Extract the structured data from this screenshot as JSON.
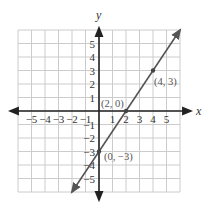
{
  "chart_data": {
    "type": "line",
    "title": "",
    "xlabel": "x",
    "ylabel": "y",
    "xlim": [
      -6,
      6
    ],
    "ylim": [
      -6,
      6
    ],
    "grid": true,
    "x_ticks": [
      -5,
      -4,
      -3,
      -2,
      -1,
      1,
      2,
      3,
      4,
      5
    ],
    "y_ticks": [
      -5,
      -4,
      -3,
      -2,
      -1,
      1,
      2,
      3,
      4,
      5
    ],
    "x_tick_labels": [
      "−5",
      "−4",
      "−3",
      "−2",
      "−1",
      "1",
      "2",
      "3",
      "4",
      "5"
    ],
    "y_tick_labels": [
      "−5",
      "−4",
      "−3",
      "−2",
      "−1",
      "1",
      "2",
      "3",
      "4",
      "5"
    ],
    "series": [
      {
        "name": "y = (3/2)x − 3",
        "x": [
          -2,
          6
        ],
        "y": [
          -6,
          6
        ],
        "color": "#555555"
      }
    ],
    "points": [
      {
        "x": 0,
        "y": -3,
        "label": "(0, −3)"
      },
      {
        "x": 2,
        "y": 0,
        "label": "(2, 0)"
      },
      {
        "x": 4,
        "y": 3,
        "label": "(4, 3)"
      }
    ]
  },
  "labels": {
    "x_axis": "x",
    "y_axis": "y",
    "pt0": "(0, −3)",
    "pt1": "(2, 0)",
    "pt2": "(4, 3)"
  },
  "colors": {
    "grid": "#cccccc",
    "axis": "#222222",
    "line": "#555555"
  }
}
